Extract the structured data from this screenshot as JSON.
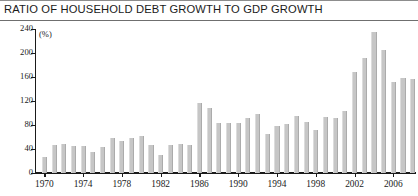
{
  "chart_data": {
    "type": "bar",
    "title": "RATIO OF HOUSEHOLD DEBT GROWTH TO GDP GROWTH",
    "unit_label": "(%)",
    "xlabel": "",
    "ylabel": "",
    "ylim": [
      0,
      240
    ],
    "yticks": [
      0,
      40,
      80,
      120,
      160,
      200,
      240
    ],
    "ytick_labels": [
      "0",
      "40",
      "80",
      "120",
      "160",
      "200",
      "240"
    ],
    "xticks": [
      1970,
      1974,
      1978,
      1982,
      1986,
      1990,
      1994,
      1998,
      2002,
      2006
    ],
    "xtick_labels": [
      "1970",
      "1974",
      "1978",
      "1982",
      "1986",
      "1990",
      "1994",
      "1998",
      "2002",
      "2006"
    ],
    "xlim": [
      1969.4,
      2008.6
    ],
    "grid": false,
    "legend": false,
    "bar_color": "#c6c6c6",
    "categories": [
      1970,
      1971,
      1972,
      1973,
      1974,
      1975,
      1976,
      1977,
      1978,
      1979,
      1980,
      1981,
      1982,
      1983,
      1984,
      1985,
      1986,
      1987,
      1988,
      1989,
      1990,
      1991,
      1992,
      1993,
      1994,
      1995,
      1996,
      1997,
      1998,
      1999,
      2000,
      2001,
      2002,
      2003,
      2004,
      2005,
      2006,
      2007,
      2008
    ],
    "values": [
      27,
      47,
      49,
      45,
      45,
      35,
      43,
      58,
      53,
      59,
      61,
      47,
      30,
      46,
      49,
      46,
      116,
      108,
      84,
      84,
      83,
      91,
      99,
      65,
      79,
      82,
      95,
      85,
      71,
      93,
      92,
      103,
      168,
      191,
      235,
      205,
      152,
      158,
      157
    ]
  }
}
